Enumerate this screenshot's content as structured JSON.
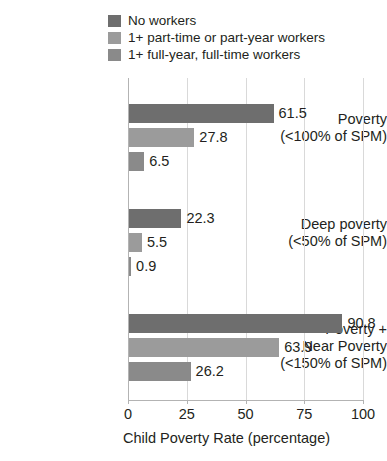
{
  "chart_data": {
    "type": "bar",
    "orientation": "horizontal",
    "title": "",
    "xlabel": "Child Poverty Rate (percentage)",
    "ylabel": "",
    "xlim": [
      0,
      100
    ],
    "xticks": [
      "0",
      "25",
      "50",
      "75",
      "100"
    ],
    "grid": true,
    "legend_position": "top-left",
    "categories": [
      "Poverty (<100% of SPM)",
      "Deep poverty (<50% of SPM)",
      "Poverty + Near Poverty (<150% of SPM)"
    ],
    "series": [
      {
        "name": "No workers",
        "values": [
          61.5,
          22.3,
          90.8
        ],
        "color": "#6e6e6e"
      },
      {
        "name": "1+ part-time or part-year workers",
        "values": [
          27.8,
          5.5,
          63.9
        ],
        "color": "#9b9b9b"
      },
      {
        "name": "1+ full-year, full-time workers",
        "values": [
          6.5,
          0.9,
          26.2
        ],
        "color": "#8a8a8a"
      }
    ]
  },
  "legend": {
    "items": [
      {
        "label": "No workers",
        "color": "#6e6e6e"
      },
      {
        "label": "1+ part-time or part-year workers",
        "color": "#9b9b9b"
      },
      {
        "label": "1+ full-year, full-time workers",
        "color": "#8a8a8a"
      }
    ]
  },
  "categories": [
    {
      "lines": [
        "Poverty",
        "(<100% of SPM)"
      ]
    },
    {
      "lines": [
        "Deep poverty",
        "(<50% of SPM)"
      ]
    },
    {
      "lines": [
        "Poverty +",
        "Near Poverty",
        "(<150% of SPM)"
      ]
    }
  ],
  "bars": [
    {
      "value": 61.5,
      "label": "61.5",
      "series": "No workers"
    },
    {
      "value": 27.8,
      "label": "27.8",
      "series": "1+ part-time or part-year workers"
    },
    {
      "value": 6.5,
      "label": "6.5",
      "series": "1+ full-year, full-time workers"
    },
    {
      "value": 22.3,
      "label": "22.3",
      "series": "No workers"
    },
    {
      "value": 5.5,
      "label": "5.5",
      "series": "1+ part-time or part-year workers"
    },
    {
      "value": 0.9,
      "label": "0.9",
      "series": "1+ full-year, full-time workers"
    },
    {
      "value": 90.8,
      "label": "90.8",
      "series": "No workers"
    },
    {
      "value": 63.9,
      "label": "63.9",
      "series": "1+ part-time or part-year workers"
    },
    {
      "value": 26.2,
      "label": "26.2",
      "series": "1+ full-year, full-time workers"
    }
  ],
  "axis": {
    "ticks": [
      "0",
      "25",
      "50",
      "75",
      "100"
    ],
    "title": "Child Poverty Rate (percentage)"
  },
  "colors": {
    "grid": "#d9d9d9",
    "axis": "#b3b3b3",
    "text": "#231f20",
    "background": "#ffffff"
  }
}
